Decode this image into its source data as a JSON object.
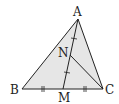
{
  "diagram": {
    "type": "triangle-geometry",
    "fill_color": "#e6e6e6",
    "stroke_color": "#222222",
    "points": {
      "A": {
        "label": "A",
        "x": 78,
        "y": 19
      },
      "B": {
        "label": "B",
        "x": 22,
        "y": 89
      },
      "C": {
        "label": "C",
        "x": 103,
        "y": 89
      },
      "M": {
        "label": "M",
        "x": 63,
        "y": 89
      },
      "N": {
        "label": "N",
        "x": 70,
        "y": 55
      }
    },
    "segments": [
      "AB",
      "BC",
      "CA",
      "AM",
      "NC"
    ],
    "tick_marks": {
      "BM_MC": "double tick (equal segments)",
      "AN_NM": "single tick (equal segments)"
    },
    "labels": {
      "A": "A",
      "B": "B",
      "C": "C",
      "M": "M",
      "N": "N"
    }
  }
}
